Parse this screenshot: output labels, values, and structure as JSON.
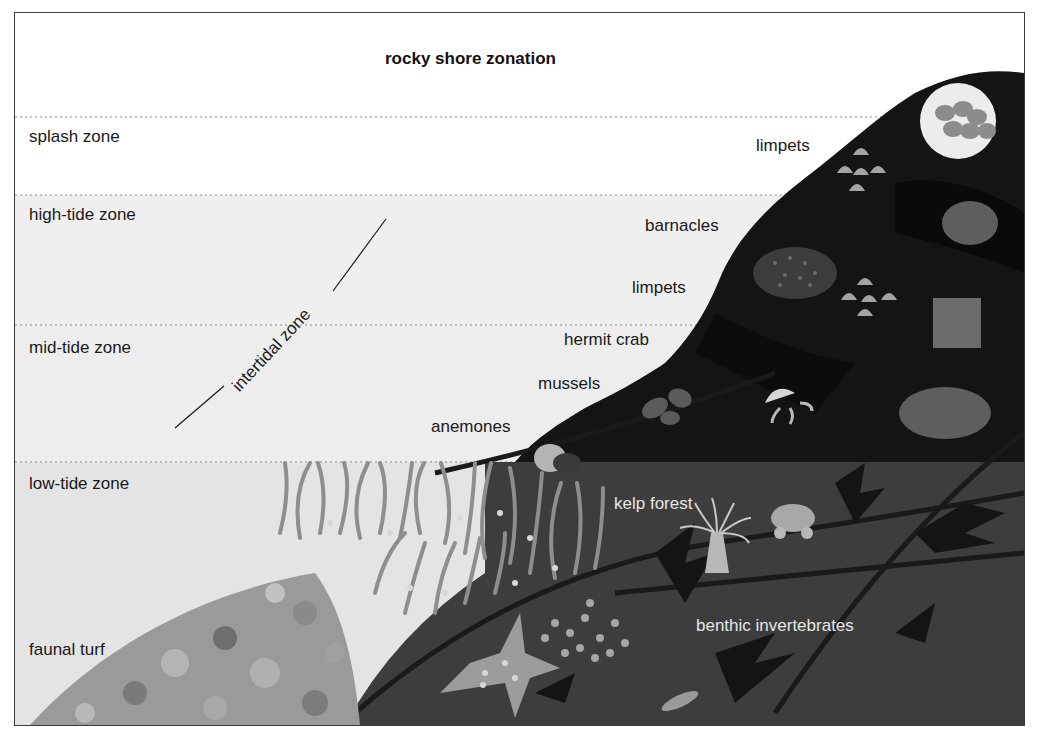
{
  "title": "rocky shore zonation",
  "zones": [
    {
      "id": "splash",
      "label": "splash zone",
      "top": 104,
      "bottom": 182,
      "fill": "#ffffff"
    },
    {
      "id": "high-tide",
      "label": "high-tide zone",
      "top": 182,
      "bottom": 312,
      "fill": "#efefef"
    },
    {
      "id": "mid-tide",
      "label": "mid-tide zone",
      "top": 312,
      "bottom": 449,
      "fill": "#ededed"
    },
    {
      "id": "low-tide",
      "label": "low-tide zone",
      "top": 449,
      "bottom": 712,
      "fill": "#e4e4e4"
    }
  ],
  "bracket_label": "intertidal zone",
  "labels": {
    "faunal_turf": "faunal turf",
    "limpets_upper": "limpets",
    "barnacles": "barnacles",
    "limpets_lower": "limpets",
    "hermit_crab": "hermit crab",
    "mussels": "mussels",
    "anemones": "anemones",
    "kelp_forest": "kelp forest",
    "benthic_invertebrates": "benthic invertebrates"
  },
  "colors": {
    "rock": "#141414",
    "rock_shade": "#0a0a0a",
    "water": "#3d3d3d",
    "kelp": "#8e8e8e",
    "turf": "#9a9a9a",
    "organism": "#bdbdbd",
    "border": "#3a3a3a",
    "dotted_line": "#8a8a8a"
  }
}
